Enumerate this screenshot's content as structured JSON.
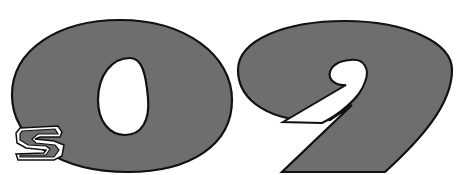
{
  "logo": {
    "text": "s09",
    "prefix": "s",
    "digits": "09",
    "fill_color": "#6e6e6e",
    "outline_color": "#111111",
    "background_color": "#ffffff"
  }
}
